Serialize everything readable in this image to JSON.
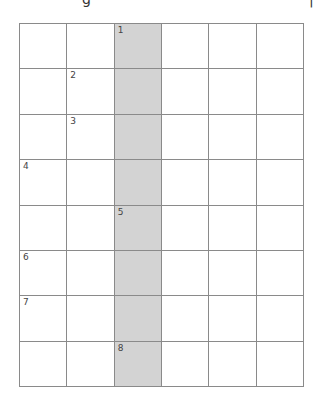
{
  "header": {
    "glyph_left": "g",
    "glyph_right": "|"
  },
  "puzzle": {
    "type": "crossword-grid",
    "columns": 6,
    "rows": 8,
    "shaded_column": 2,
    "colors": {
      "shaded": "#d3d3d3",
      "line": "#8a8a8a",
      "cell": "#ffffff"
    },
    "clue_numbers": [
      {
        "label": "1",
        "row": 0,
        "col": 2
      },
      {
        "label": "2",
        "row": 1,
        "col": 1
      },
      {
        "label": "3",
        "row": 2,
        "col": 1
      },
      {
        "label": "4",
        "row": 3,
        "col": 0
      },
      {
        "label": "5",
        "row": 4,
        "col": 2
      },
      {
        "label": "6",
        "row": 5,
        "col": 0
      },
      {
        "label": "7",
        "row": 6,
        "col": 0
      },
      {
        "label": "8",
        "row": 7,
        "col": 2
      }
    ]
  }
}
